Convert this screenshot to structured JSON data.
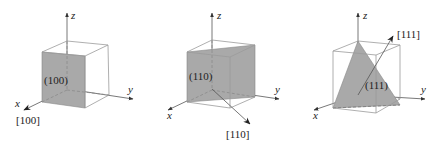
{
  "figure": {
    "panels": [
      {
        "plane_label": "(100)",
        "direction_label": "[100]",
        "axes": {
          "x": "x",
          "y": "y",
          "z": "z"
        }
      },
      {
        "plane_label": "(110)",
        "direction_label": "[110]",
        "axes": {
          "x": "x",
          "y": "y",
          "z": "z"
        }
      },
      {
        "plane_label": "(111)",
        "direction_label": "[111]",
        "axes": {
          "x": "x",
          "y": "y",
          "z": "z"
        }
      }
    ],
    "colors": {
      "plane_fill": "#a9a9a9",
      "edge": "#9a9a9a",
      "axis": "#555555",
      "text": "#222222"
    }
  }
}
